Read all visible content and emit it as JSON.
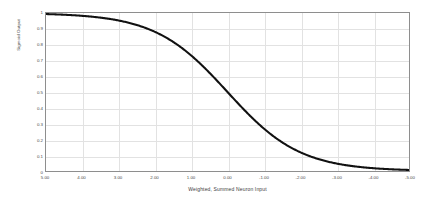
{
  "chart_data": {
    "type": "line",
    "title": "",
    "xlabel": "Weighted, Summed Neuron Input",
    "ylabel": "Sigmoid Output",
    "xlim": [
      5,
      -5
    ],
    "ylim": [
      0,
      1
    ],
    "x_reversed": true,
    "grid": true,
    "legend": "none",
    "line_color": "#111111",
    "grid_color": "#e2e2e2",
    "axis_color": "#8e8e8e",
    "background_color": "#ffffff",
    "xticklabels": [
      "5.00",
      "4.00",
      "3.00",
      "2.00",
      "1.00",
      "0.00",
      "-1.00",
      "-2.00",
      "-3.00",
      "-4.00",
      "-5.00"
    ],
    "xticks": [
      5,
      4,
      3,
      2,
      1,
      0,
      -1,
      -2,
      -3,
      -4,
      -5
    ],
    "yticklabels": [
      "1",
      "0.9",
      "0.8",
      "0.7",
      "0.6",
      "0.5",
      "0.4",
      "0.3",
      "0.2",
      "0.1",
      "0"
    ],
    "yticks": [
      1,
      0.9,
      0.8,
      0.7,
      0.6,
      0.5,
      0.4,
      0.3,
      0.2,
      0.1,
      0
    ],
    "series": [
      {
        "name": "sigmoid",
        "x": [
          5,
          4.5,
          4,
          3.5,
          3,
          2.5,
          2,
          1.5,
          1,
          0.5,
          0,
          -0.5,
          -1,
          -1.5,
          -2,
          -2.5,
          -3,
          -3.5,
          -4,
          -4.5,
          -5
        ],
        "values": [
          0.993,
          0.989,
          0.982,
          0.97,
          0.953,
          0.924,
          0.881,
          0.818,
          0.731,
          0.622,
          0.5,
          0.378,
          0.269,
          0.182,
          0.119,
          0.076,
          0.047,
          0.029,
          0.018,
          0.011,
          0.007
        ]
      }
    ]
  }
}
